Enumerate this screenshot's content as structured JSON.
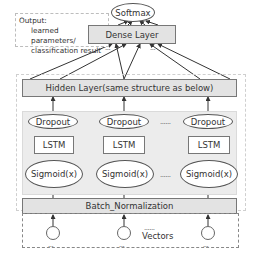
{
  "output_note": {
    "line1": "Output:",
    "line2": "learned parameters/",
    "line3": "classification result"
  },
  "softmax": {
    "label": "Softmax"
  },
  "dense_layer": {
    "label": "Dense Layer"
  },
  "hidden_layer": {
    "label": "Hidden Layer(same structure as below)"
  },
  "units": [
    {
      "dropout": "Dropout",
      "lstm": "LSTM",
      "activation": "Sigmoid(x)"
    },
    {
      "dropout": "Dropout",
      "lstm": "LSTM",
      "activation": "Sigmoid(x)"
    },
    {
      "dropout": "Dropout",
      "lstm": "LSTM",
      "activation": "Sigmoid(x)"
    }
  ],
  "ellipsis": "......",
  "batch_norm": {
    "label": "Batch_Normalization"
  },
  "vectors": {
    "label": "Vectors",
    "dots": "......",
    "sub_dots": "..."
  },
  "colors": {
    "layer_fill": "#e3e3e3",
    "region_fill": "#ececec",
    "stroke": "#555555",
    "dashed": "#bdbdbd"
  }
}
